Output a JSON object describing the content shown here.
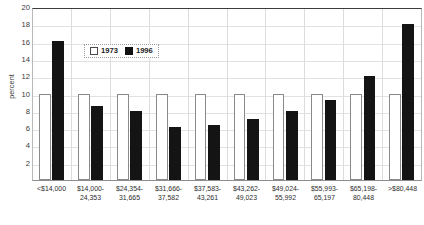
{
  "chart_data": {
    "type": "bar",
    "title": "",
    "subtitle": "",
    "xlabel": "",
    "ylabel": "percent",
    "ylim": [
      0,
      20
    ],
    "ytick_step": 2,
    "yticks": [
      20,
      18,
      16,
      14,
      12,
      10,
      8,
      6,
      4,
      2
    ],
    "grid": true,
    "legend_position": "inside-top-left",
    "categories": [
      "<$14,000",
      "$14,000-24,353",
      "$24,354-31,665",
      "$31,666-37,582",
      "$37,583-43,261",
      "$43,262-49,023",
      "$49,024-55,992",
      "$55,993-65,197",
      "$65,198-80,448",
      ">$80,448"
    ],
    "category_lines": [
      [
        "<$14,000",
        ""
      ],
      [
        "$14,000-",
        "24,353"
      ],
      [
        "$24,354-",
        "31,665"
      ],
      [
        "$31,666-",
        "37,582"
      ],
      [
        "$37,583-",
        "43,261"
      ],
      [
        "$43,262-",
        "49,023"
      ],
      [
        "$49,024-",
        "55,992"
      ],
      [
        "$55,993-",
        "65,197"
      ],
      [
        "$65,198-",
        "80,448"
      ],
      [
        ">$80,448",
        ""
      ]
    ],
    "series": [
      {
        "name": "1973",
        "color": "#ffffff",
        "edge_color": "#8a8a8a",
        "values": [
          10,
          10,
          10,
          10,
          10,
          10,
          10,
          10,
          10,
          10
        ]
      },
      {
        "name": "1996",
        "color": "#141414",
        "edge_color": "#141414",
        "values": [
          16.1,
          8.6,
          8.0,
          6.1,
          6.4,
          7.0,
          8.0,
          9.3,
          12.0,
          18.0
        ]
      }
    ]
  },
  "legend": {
    "items": [
      {
        "label": "1973",
        "swatch": "hollow-square-swatch"
      },
      {
        "label": "1996",
        "swatch": "solid-square-swatch"
      }
    ]
  }
}
